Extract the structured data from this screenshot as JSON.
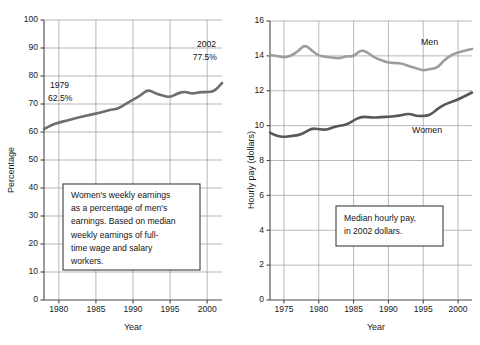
{
  "figure": {
    "background": "#ffffff",
    "panels": [
      "left-chart-percentage",
      "right-chart-hourly-pay"
    ]
  },
  "left": {
    "axis_title_y": "Percentage",
    "axis_title_x": "Year",
    "y_ticks": [
      "0",
      "10",
      "20",
      "30",
      "40",
      "50",
      "60",
      "70",
      "80",
      "90",
      "100"
    ],
    "x_ticks": [
      "1980",
      "1985",
      "1990",
      "1995",
      "2000"
    ],
    "annotations": {
      "start_year": "1979",
      "start_value": "62.5%",
      "end_year": "2002",
      "end_value": "77.5%"
    },
    "callout": {
      "lines": [
        "Women's weekly earnings",
        "as a percentage of men's",
        "earnings. Based on median",
        "weekly earnings of full-",
        "time wage and salary",
        "workers."
      ]
    }
  },
  "right": {
    "axis_title_y": "Hourly pay (dollars)",
    "axis_title_x": "Year",
    "y_ticks": [
      "0",
      "2",
      "4",
      "6",
      "8",
      "10",
      "12",
      "14",
      "16"
    ],
    "x_ticks": [
      "1975",
      "1980",
      "1985",
      "1990",
      "1995",
      "2000"
    ],
    "series_labels": {
      "men": "Men",
      "women": "Women"
    },
    "callout": {
      "lines": [
        "Median hourly pay,",
        "in 2002 dollars."
      ]
    }
  },
  "colors": {
    "line_women_hourly": "#575757",
    "line_men_hourly": "#9d9d9d",
    "line_percentage": "#6e6e6e",
    "gridline": "#9a9aa2",
    "axis": "#4a4a4a",
    "text": "#141414"
  },
  "chart_data": [
    {
      "type": "line",
      "id": "left-chart-percentage",
      "title": "",
      "xlabel": "Year",
      "ylabel": "Percentage",
      "xlim": [
        1978,
        2002
      ],
      "ylim": [
        0,
        100
      ],
      "grid": true,
      "legend": "none",
      "x": [
        1978,
        1979,
        1980,
        1981,
        1982,
        1983,
        1984,
        1985,
        1986,
        1987,
        1988,
        1989,
        1990,
        1991,
        1992,
        1993,
        1994,
        1995,
        1996,
        1997,
        1998,
        1999,
        2000,
        2001,
        2002
      ],
      "series": [
        {
          "name": "Women's weekly earnings as a percentage of men's",
          "values": [
            61.0,
            62.5,
            63.4,
            64.0,
            64.8,
            65.4,
            66.0,
            66.6,
            67.2,
            68.0,
            68.3,
            70.0,
            71.5,
            73.0,
            75.2,
            73.8,
            73.0,
            72.4,
            73.8,
            74.5,
            73.6,
            74.3,
            74.2,
            74.6,
            77.5
          ]
        }
      ],
      "annotations": [
        {
          "text": "1979\n62.5%",
          "x": 1979,
          "y": 62.5
        },
        {
          "text": "2002\n77.5%",
          "x": 2002,
          "y": 77.5
        }
      ]
    },
    {
      "type": "line",
      "id": "right-chart-hourly-pay",
      "title": "",
      "xlabel": "Year",
      "ylabel": "Hourly pay (dollars)",
      "xlim": [
        1973,
        2002
      ],
      "ylim": [
        0,
        16
      ],
      "grid": true,
      "legend": "inline-labels",
      "x": [
        1973,
        1974,
        1975,
        1976,
        1977,
        1978,
        1979,
        1980,
        1981,
        1982,
        1983,
        1984,
        1985,
        1986,
        1987,
        1988,
        1989,
        1990,
        1991,
        1992,
        1993,
        1994,
        1995,
        1996,
        1997,
        1998,
        1999,
        2000,
        2001,
        2002
      ],
      "series": [
        {
          "name": "Men",
          "values": [
            14.05,
            14.0,
            13.9,
            14.0,
            14.25,
            14.65,
            14.3,
            14.0,
            13.95,
            13.9,
            13.85,
            14.0,
            13.95,
            14.35,
            14.2,
            13.9,
            13.75,
            13.6,
            13.6,
            13.55,
            13.4,
            13.3,
            13.15,
            13.25,
            13.3,
            13.75,
            14.05,
            14.2,
            14.3,
            14.4
          ]
        },
        {
          "name": "Women",
          "values": [
            9.6,
            9.4,
            9.35,
            9.4,
            9.45,
            9.6,
            9.85,
            9.8,
            9.75,
            9.9,
            10.0,
            10.05,
            10.3,
            10.5,
            10.5,
            10.45,
            10.5,
            10.5,
            10.55,
            10.6,
            10.7,
            10.55,
            10.55,
            10.6,
            10.95,
            11.2,
            11.35,
            11.5,
            11.7,
            11.9
          ]
        }
      ],
      "annotations": [
        {
          "text": "Men",
          "x": 2000,
          "y": 15.3
        },
        {
          "text": "Women",
          "x": 2000,
          "y": 10.2
        }
      ]
    }
  ]
}
